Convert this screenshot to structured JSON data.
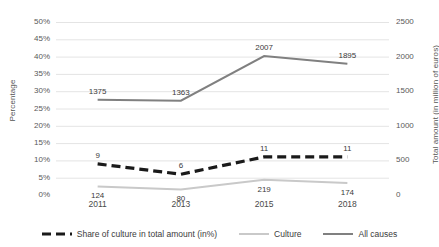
{
  "chart_data": {
    "type": "line",
    "title": "",
    "xlabel": "",
    "categories": [
      "2011",
      "2013",
      "2015",
      "2018"
    ],
    "grid": true,
    "legend_position": "bottom",
    "axes": {
      "left": {
        "label": "Percentage",
        "ticks": [
          "0%",
          "5%",
          "10%",
          "15%",
          "20%",
          "25%",
          "30%",
          "35%",
          "40%",
          "45%",
          "50%"
        ],
        "min": 0,
        "max": 50,
        "step": 5,
        "unit": "%"
      },
      "right": {
        "label": "Total amount (in million of euros)",
        "ticks": [
          "0",
          "500",
          "1000",
          "1500",
          "2000",
          "2500"
        ],
        "min": 0,
        "max": 2500,
        "step": 500,
        "unit": "million euros"
      }
    },
    "series": [
      {
        "name": "Share of culture in total amount (in%)",
        "axis": "left",
        "style": "dashed",
        "color": "#1a1a1a",
        "values": [
          9,
          6,
          11,
          11
        ],
        "labels": [
          "9",
          "6",
          "11",
          "11"
        ]
      },
      {
        "name": "Culture",
        "axis": "right",
        "style": "solid",
        "color": "#c9c9c9",
        "values": [
          124,
          80,
          219,
          174
        ],
        "labels": [
          "124",
          "80",
          "219",
          "174"
        ]
      },
      {
        "name": "All causes",
        "axis": "right",
        "style": "solid",
        "color": "#808080",
        "values": [
          1375,
          1363,
          2007,
          1895
        ],
        "labels": [
          "1375",
          "1363",
          "2007",
          "1895"
        ]
      }
    ]
  },
  "colors": {
    "grid": "#e4e4e4",
    "text": "#595959",
    "share_line": "#1a1a1a",
    "culture_line": "#c9c9c9",
    "all_causes_line": "#808080"
  }
}
